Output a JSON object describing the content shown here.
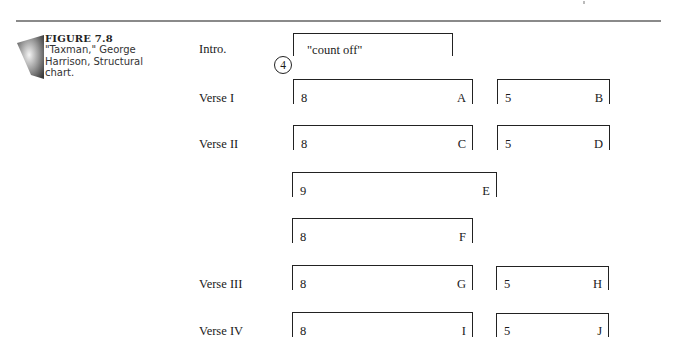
{
  "caption": {
    "figure_label": "FIGURE 7.8",
    "description": "\"Taxman,\" George Harrison, Structural chart.",
    "icon": "gradient-trapezoid-icon"
  },
  "sections": [
    {
      "label": "Intro.",
      "blocks": [
        {
          "text": "\"count off\""
        }
      ],
      "count_in": "4"
    },
    {
      "label": "Verse I",
      "blocks": [
        {
          "bars": "8",
          "letter": "A"
        },
        {
          "bars": "5",
          "letter": "B"
        }
      ]
    },
    {
      "label": "Verse II",
      "blocks": [
        {
          "bars": "8",
          "letter": "C"
        },
        {
          "bars": "5",
          "letter": "D"
        }
      ]
    },
    {
      "label": "",
      "blocks": [
        {
          "bars": "9",
          "letter": "E"
        }
      ]
    },
    {
      "label": "",
      "blocks": [
        {
          "bars": "8",
          "letter": "F"
        }
      ]
    },
    {
      "label": "Verse III",
      "blocks": [
        {
          "bars": "8",
          "letter": "G"
        },
        {
          "bars": "5",
          "letter": "H"
        }
      ]
    },
    {
      "label": "Verse IV",
      "blocks": [
        {
          "bars": "8",
          "letter": "I"
        },
        {
          "bars": "5",
          "letter": "J"
        }
      ]
    }
  ]
}
